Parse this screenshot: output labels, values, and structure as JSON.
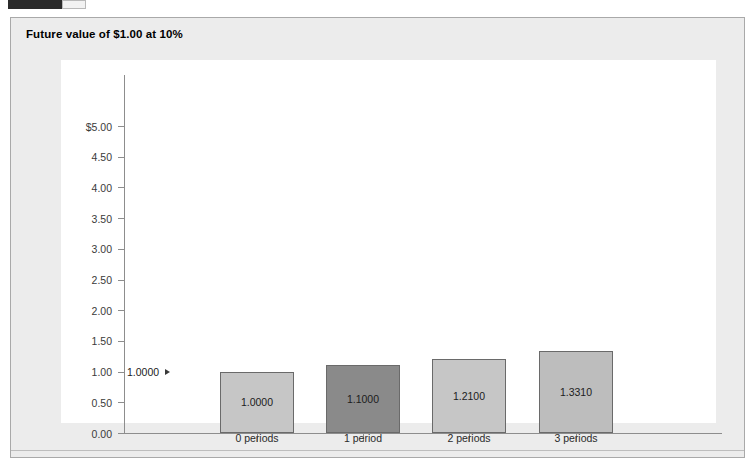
{
  "top_widget": {
    "name": "cropped-toolbar-strip"
  },
  "panel": {
    "title": "Future value of $1.00 at 10%"
  },
  "chart_data": {
    "type": "bar",
    "title": "Future value of $1.00 at 10%",
    "xlabel": "",
    "ylabel": "",
    "categories": [
      "0 periods",
      "1 period",
      "2 periods",
      "3 periods"
    ],
    "values": [
      1.0,
      1.1,
      1.21,
      1.331
    ],
    "bar_labels": [
      "1.0000",
      "1.1000",
      "1.2100",
      "1.3310"
    ],
    "bar_colors": [
      "#c6c6c6",
      "#8a8a8a",
      "#c6c6c6",
      "#bdbdbd"
    ],
    "ylim": [
      0.0,
      5.0
    ],
    "ytick_labels": [
      "$5.00",
      "4.50",
      "4.00",
      "3.50",
      "3.00",
      "2.50",
      "2.00",
      "1.50",
      "1.00",
      "0.50",
      "0.00"
    ],
    "ytick_values": [
      5.0,
      4.5,
      4.0,
      3.5,
      3.0,
      2.5,
      2.0,
      1.5,
      1.0,
      0.5,
      0.0
    ],
    "grid": false,
    "legend": "none",
    "annotations": [
      {
        "text": "1.0000",
        "target_value": 1.0,
        "target_category": "0 periods"
      }
    ]
  }
}
